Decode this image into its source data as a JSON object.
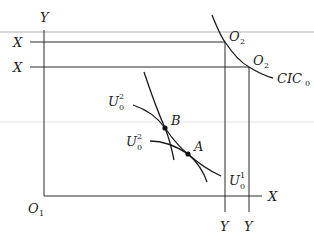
{
  "diagram": {
    "type": "edgeworth-box",
    "colors": {
      "line": "#2a2a2a",
      "curve": "#1a1a1a",
      "background": "#ffffff",
      "artifact": "#c8c8c8"
    },
    "axis_labels": {
      "y_top_left": "Y",
      "x_upper": "X",
      "x_lower": "X",
      "x_bottom_right": "X",
      "y_bottom_1": "Y",
      "y_bottom_2": "Y"
    },
    "origins": {
      "o1": {
        "base": "O",
        "sub": "1"
      },
      "o2_upper": {
        "base": "O",
        "sub": "2"
      },
      "o2_lower": {
        "base": "O",
        "sub": "2"
      }
    },
    "curves": {
      "cic": {
        "base": "CIC",
        "sub": "0"
      },
      "u_upper": {
        "base": "U",
        "sup": "2",
        "sub": "0"
      },
      "u_middle": {
        "base": "U",
        "sup": "2",
        "sub": "0"
      },
      "u_lower": {
        "base": "U",
        "sup": "1",
        "sub": "0"
      }
    },
    "points": {
      "b": "B",
      "a": "A"
    }
  }
}
